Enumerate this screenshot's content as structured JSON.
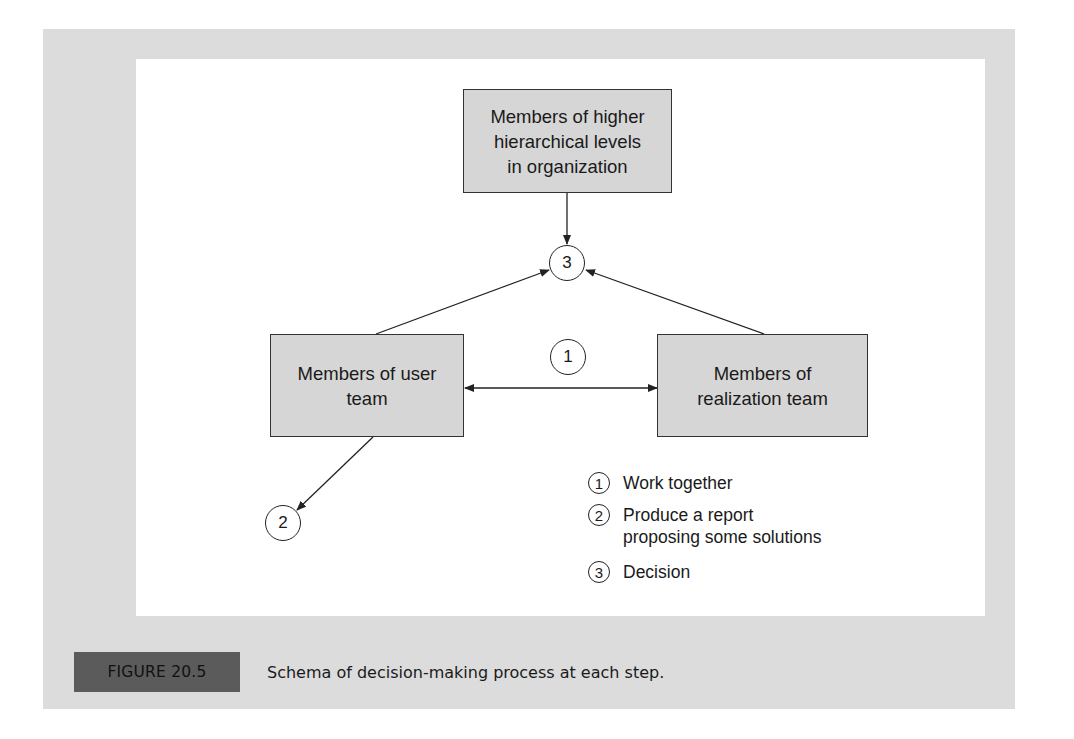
{
  "diagram": {
    "nodes": {
      "higher": {
        "lines": [
          "Members of higher",
          "hierarchical levels",
          "in organization"
        ]
      },
      "user": {
        "lines": [
          "Members of user",
          "team"
        ]
      },
      "realization": {
        "lines": [
          "Members of",
          "realization team"
        ]
      }
    },
    "markers": {
      "m1": "1",
      "m2": "2",
      "m3": "3"
    },
    "edges": [
      {
        "from": "higher",
        "to": "m3",
        "type": "arrow"
      },
      {
        "from": "user",
        "to": "m3",
        "type": "arrow"
      },
      {
        "from": "realization",
        "to": "m3",
        "type": "arrow"
      },
      {
        "from": "user",
        "to": "realization",
        "type": "double-arrow",
        "label": "1"
      },
      {
        "from": "user",
        "to": "m2",
        "type": "arrow"
      }
    ],
    "colors": {
      "frame": "#dcdcdc",
      "box_fill": "#d6d6d6",
      "label_fill": "#5b5b5b",
      "stroke": "#222222"
    }
  },
  "legend": [
    {
      "num": "1",
      "lines": [
        "Work together"
      ]
    },
    {
      "num": "2",
      "lines": [
        "Produce a report",
        "proposing some solutions"
      ]
    },
    {
      "num": "3",
      "lines": [
        "Decision"
      ]
    }
  ],
  "figure": {
    "label": "FIGURE 20.5",
    "caption": "Schema of decision-making process at each step."
  }
}
